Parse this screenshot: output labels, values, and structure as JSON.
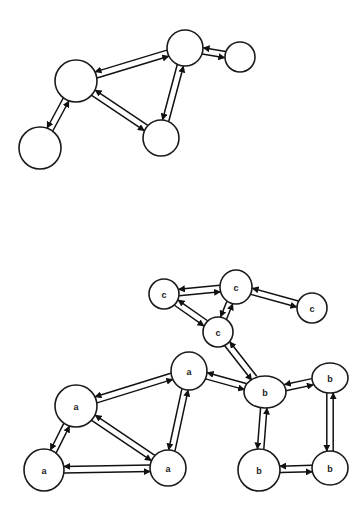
{
  "figure": {
    "top_graph": {
      "nodes": [
        {
          "id": "t1",
          "label": "",
          "cx": 76,
          "cy": 81,
          "rx": 21,
          "ry": 21
        },
        {
          "id": "t2",
          "label": "",
          "cx": 40,
          "cy": 148,
          "rx": 21,
          "ry": 21
        },
        {
          "id": "t3",
          "label": "",
          "cx": 185,
          "cy": 48,
          "rx": 18,
          "ry": 18
        },
        {
          "id": "t4",
          "label": "",
          "cx": 240,
          "cy": 57,
          "rx": 15,
          "ry": 15
        },
        {
          "id": "t5",
          "label": "",
          "cx": 161,
          "cy": 138,
          "rx": 18,
          "ry": 18
        }
      ],
      "edges": [
        [
          "t1",
          "t3"
        ],
        [
          "t3",
          "t1"
        ],
        [
          "t3",
          "t4"
        ],
        [
          "t4",
          "t3"
        ],
        [
          "t1",
          "t5"
        ],
        [
          "t5",
          "t1"
        ],
        [
          "t3",
          "t5"
        ],
        [
          "t5",
          "t3"
        ],
        [
          "t2",
          "t1"
        ],
        [
          "t1",
          "t2"
        ]
      ]
    },
    "bottom_graph": {
      "nodes": [
        {
          "id": "c1",
          "label": "c",
          "cx": 164,
          "cy": 294,
          "rx": 15,
          "ry": 15
        },
        {
          "id": "c2",
          "label": "c",
          "cx": 236,
          "cy": 287,
          "rx": 16,
          "ry": 17
        },
        {
          "id": "c3",
          "label": "c",
          "cx": 312,
          "cy": 308,
          "rx": 15,
          "ry": 15
        },
        {
          "id": "c4",
          "label": "c",
          "cx": 218,
          "cy": 332,
          "rx": 15,
          "ry": 15
        },
        {
          "id": "a1",
          "label": "a",
          "cx": 76,
          "cy": 406,
          "rx": 21,
          "ry": 21
        },
        {
          "id": "a2",
          "label": "a",
          "cx": 189,
          "cy": 371,
          "rx": 18,
          "ry": 19
        },
        {
          "id": "a3",
          "label": "a",
          "cx": 44,
          "cy": 470,
          "rx": 20,
          "ry": 21
        },
        {
          "id": "a4",
          "label": "a",
          "cx": 168,
          "cy": 468,
          "rx": 18,
          "ry": 18
        },
        {
          "id": "b1",
          "label": "b",
          "cx": 265,
          "cy": 392,
          "rx": 21,
          "ry": 16
        },
        {
          "id": "b2",
          "label": "b",
          "cx": 330,
          "cy": 378,
          "rx": 18,
          "ry": 15
        },
        {
          "id": "b3",
          "label": "b",
          "cx": 259,
          "cy": 470,
          "rx": 21,
          "ry": 21
        },
        {
          "id": "b4",
          "label": "b",
          "cx": 330,
          "cy": 468,
          "rx": 18,
          "ry": 17
        }
      ],
      "edges": [
        [
          "c1",
          "c2"
        ],
        [
          "c2",
          "c1"
        ],
        [
          "c2",
          "c3"
        ],
        [
          "c3",
          "c2"
        ],
        [
          "c1",
          "c4"
        ],
        [
          "c4",
          "c1"
        ],
        [
          "c2",
          "c4"
        ],
        [
          "c4",
          "c2"
        ],
        [
          "c4",
          "b1"
        ],
        [
          "b1",
          "c4"
        ],
        [
          "a1",
          "a2"
        ],
        [
          "a2",
          "a1"
        ],
        [
          "a1",
          "a4"
        ],
        [
          "a4",
          "a1"
        ],
        [
          "a2",
          "a4"
        ],
        [
          "a4",
          "a2"
        ],
        [
          "a3",
          "a1"
        ],
        [
          "a1",
          "a3"
        ],
        [
          "a3",
          "a4"
        ],
        [
          "a4",
          "a3"
        ],
        [
          "a2",
          "b1"
        ],
        [
          "b1",
          "a2"
        ],
        [
          "b1",
          "b2"
        ],
        [
          "b2",
          "b1"
        ],
        [
          "b1",
          "b3"
        ],
        [
          "b3",
          "b1"
        ],
        [
          "b2",
          "b4"
        ],
        [
          "b4",
          "b2"
        ],
        [
          "b3",
          "b4"
        ],
        [
          "b4",
          "b3"
        ]
      ]
    }
  }
}
